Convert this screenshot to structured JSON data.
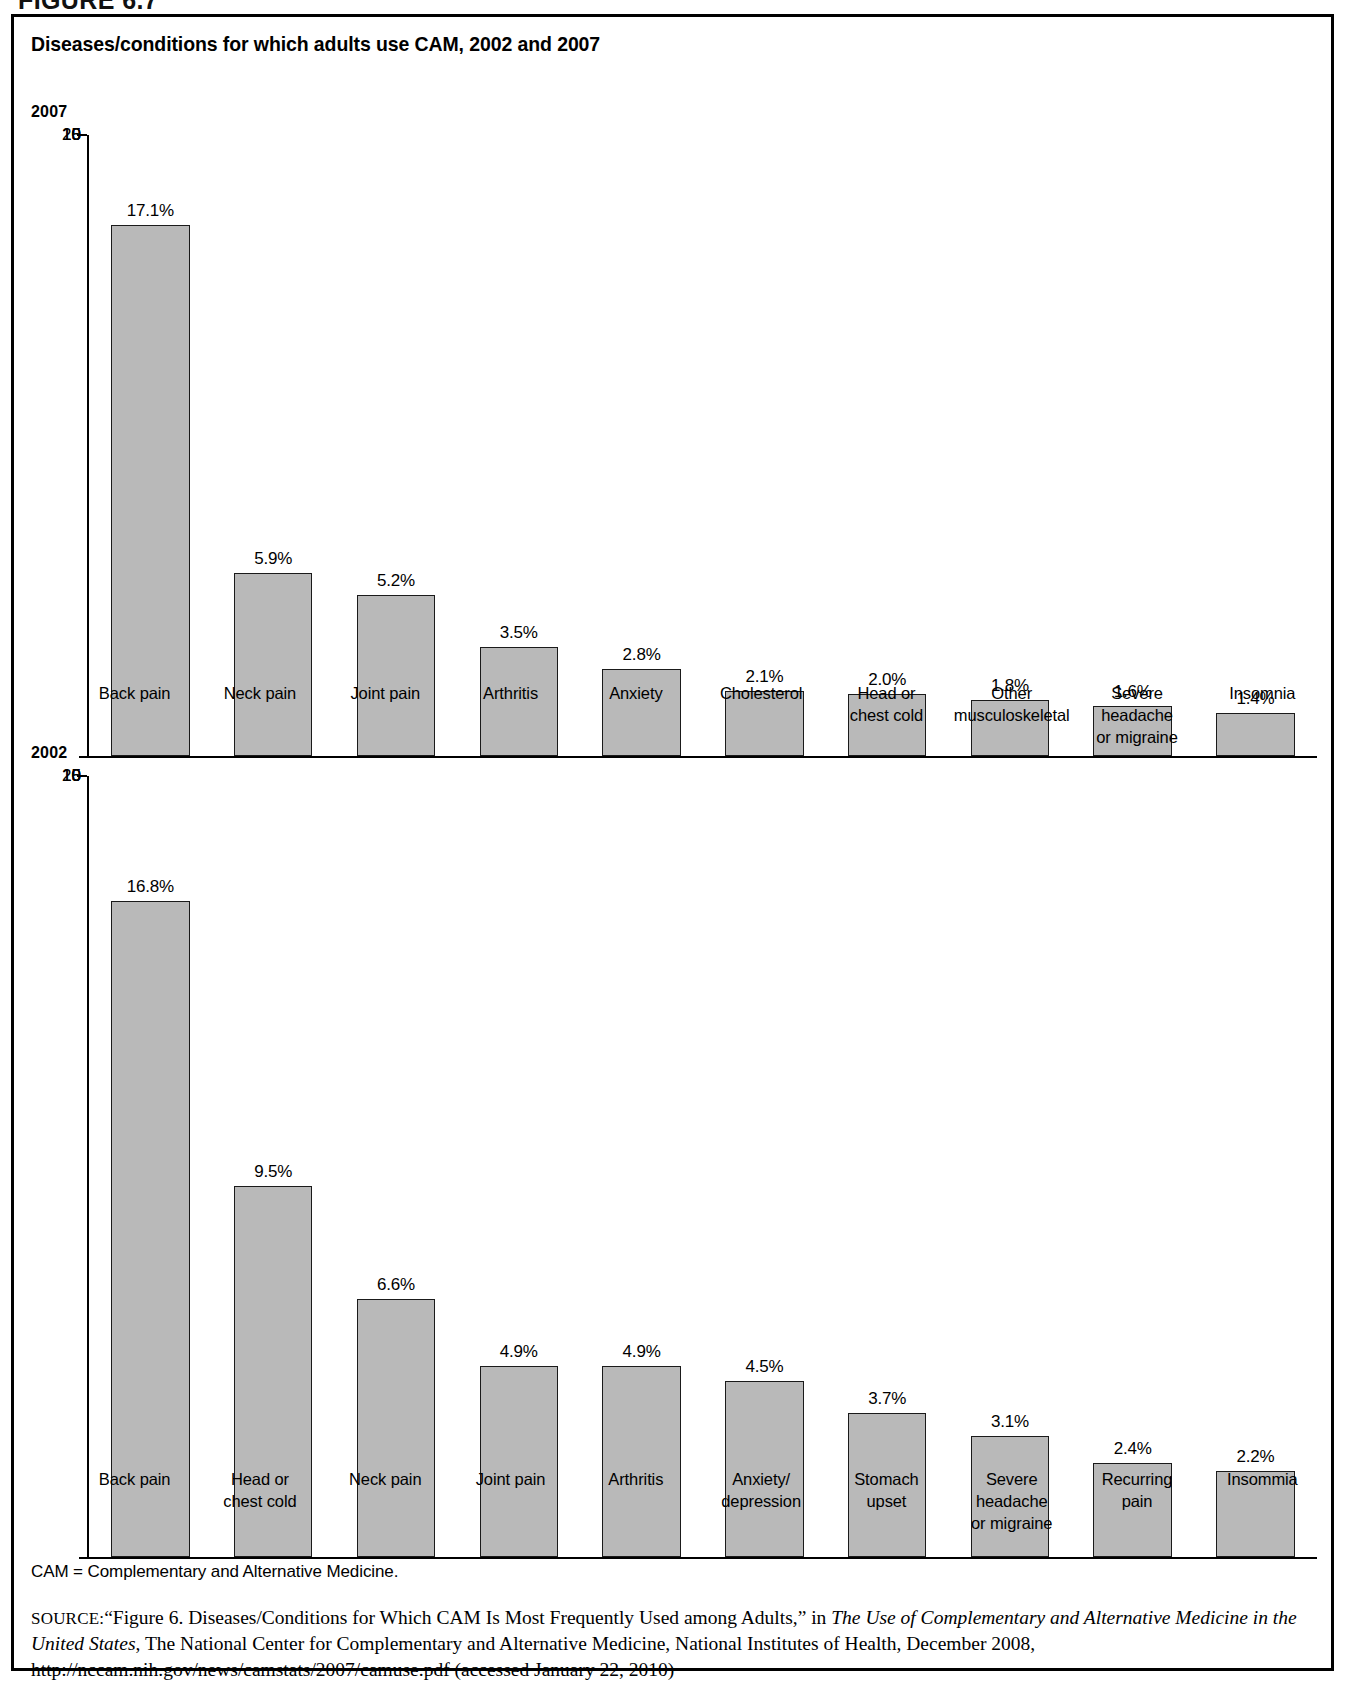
{
  "figure_header": "FIGURE 6.7",
  "figure": {
    "title": "Diseases/conditions for which adults use CAM, 2002 and 2007",
    "footnote": "CAM = Complementary and Alternative Medicine.",
    "source": {
      "label": "SOURCE:",
      "part1": "“Figure 6. Diseases/Conditions for Which CAM Is Most Frequently Used among Adults,” in ",
      "italic1": "The Use of Complementary and Alternative Medicine in the United States",
      "part2": ", The National Center for Complementary and Alternative Medicine, National Institutes of Health, December 2008, http://nccam.nih.gov/news/camstats/2007/camuse.pdf (accessed January 22, 2010)"
    }
  },
  "panels": [
    {
      "id": "panel-2007",
      "year_label": "2007"
    },
    {
      "id": "panel-2002",
      "year_label": "2002"
    }
  ],
  "axis": {
    "ticks": [
      "0",
      "5",
      "10",
      "15",
      "20"
    ]
  },
  "chart_data": [
    {
      "type": "bar",
      "title": "2007",
      "xlabel": "",
      "ylabel": "",
      "ylim": [
        0,
        20
      ],
      "yticks": [
        0,
        5,
        10,
        15,
        20
      ],
      "grid": false,
      "legend": "none",
      "unit": "percent",
      "categories": [
        "Back pain",
        "Neck pain",
        "Joint pain",
        "Arthritis",
        "Anxiety",
        "Cholesterol",
        "Head or\nchest cold",
        "Other\nmusculoskeletal",
        "Severe headache\nor migraine",
        "Insomnia"
      ],
      "values": [
        17.1,
        5.9,
        5.2,
        3.5,
        2.8,
        2.1,
        2.0,
        1.8,
        1.6,
        1.4
      ],
      "data_labels": [
        "17.1%",
        "5.9%",
        "5.2%",
        "3.5%",
        "2.8%",
        "2.1%",
        "2.0%",
        "1.8%",
        "1.6%",
        "1.4%"
      ]
    },
    {
      "type": "bar",
      "title": "2002",
      "xlabel": "",
      "ylabel": "",
      "ylim": [
        0,
        20
      ],
      "yticks": [
        0,
        5,
        10,
        15,
        20
      ],
      "grid": false,
      "legend": "none",
      "unit": "percent",
      "categories": [
        "Back pain",
        "Head or\nchest cold",
        "Neck pain",
        "Joint pain",
        "Arthritis",
        "Anxiety/\ndepression",
        "Stomach\nupset",
        "Severe\nheadache\nor migraine",
        "Recurring\npain",
        "Insommia"
      ],
      "values": [
        16.8,
        9.5,
        6.6,
        4.9,
        4.9,
        4.5,
        3.7,
        3.1,
        2.4,
        2.2
      ],
      "data_labels": [
        "16.8%",
        "9.5%",
        "6.6%",
        "4.9%",
        "4.9%",
        "4.5%",
        "3.7%",
        "3.1%",
        "2.4%",
        "2.2%"
      ]
    }
  ],
  "colors": {
    "bar_fill": "#b9b9b9",
    "bar_stroke": "#1a1a1a",
    "axis": "#000000",
    "background": "#ffffff"
  }
}
